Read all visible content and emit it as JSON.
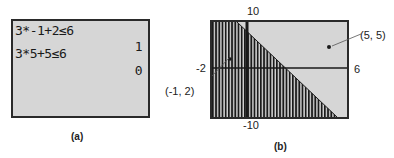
{
  "panel_a": {
    "caption": "(a)",
    "lines": [
      {
        "expr": "3*-1+2≤6",
        "result": "1"
      },
      {
        "expr": "3*5+5≤6",
        "result": "0"
      }
    ]
  },
  "panel_b": {
    "caption": "(b)",
    "window": {
      "xmin": "-2",
      "xmax": "6",
      "ymin": "-10",
      "ymax": "10"
    },
    "points": [
      {
        "label": "(-1, 2)",
        "x": -1,
        "y": 2
      },
      {
        "label": "(5, 5)",
        "x": 5,
        "y": 5
      }
    ],
    "inequality_shaded": "below line y = -3x + 6",
    "colors": {
      "screen": "#d6d6d6",
      "ink": "#1a1a1a"
    }
  }
}
